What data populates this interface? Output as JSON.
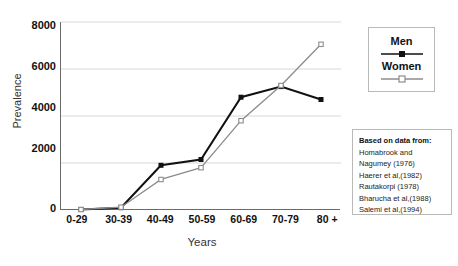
{
  "chart_data": {
    "type": "line",
    "title": "",
    "xlabel": "Years",
    "ylabel": "Prevalence",
    "categories": [
      "0-29",
      "30-39",
      "40-49",
      "50-59",
      "60-69",
      "70-79",
      "80 +"
    ],
    "ylim": [
      0,
      8000
    ],
    "yticks": [
      8000,
      6000,
      4000,
      2000,
      0
    ],
    "grid": true,
    "legend_position": "top-right",
    "series": [
      {
        "name": "Men",
        "color": "#111111",
        "marker": "filled-square",
        "values": [
          20,
          100,
          1900,
          2150,
          4800,
          5250,
          4700
        ]
      },
      {
        "name": "Women",
        "color": "#8c8c8c",
        "marker": "open-square",
        "values": [
          20,
          120,
          1300,
          1800,
          3800,
          5300,
          7050
        ]
      }
    ]
  },
  "legend": {
    "items": [
      {
        "label": "Men",
        "sample": "black-line-filled-square-marker"
      },
      {
        "label": "Women",
        "sample": "gray-line-open-square-marker"
      }
    ]
  },
  "source_box": {
    "heading": "Based on data from:",
    "lines": [
      "Homabrook and",
      "Nagumey (1976)",
      "Haerer et al,(1982)",
      "Rautakorpi (1978)",
      "Bharucha et al,(1988)",
      "Salemi et al,(1994)"
    ]
  },
  "colors": {
    "men": "#111111",
    "women": "#8c8c8c",
    "axis": "#6b6b6b",
    "grid": "#d8d8d8",
    "box_border": "#b9b9b9",
    "background": "#ffffff"
  }
}
